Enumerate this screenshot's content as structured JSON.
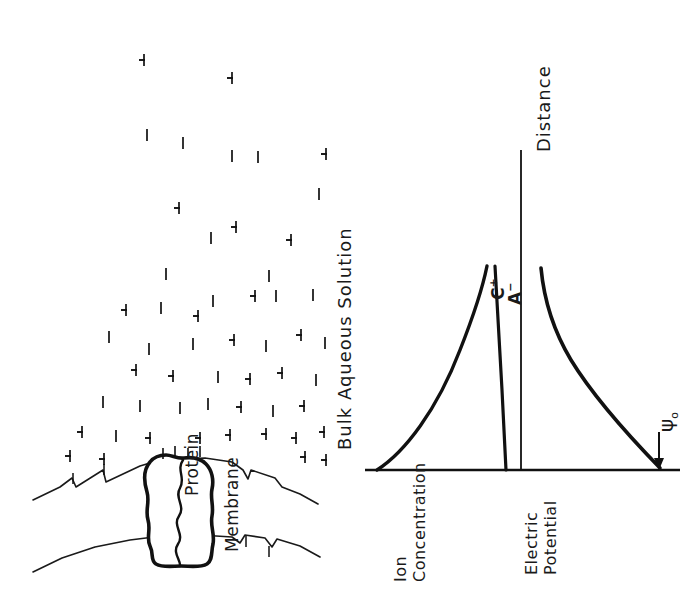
{
  "figure": {
    "type": "scientific-diagram",
    "orientation_note": "rotated-90-ccw",
    "background_color": "#ffffff",
    "ink_color": "#111111"
  },
  "left_panel": {
    "name": "membrane-ion-distribution",
    "solution_label": "Bulk  Aqueous  Solution",
    "protein_label": "Protein",
    "membrane_label": "Membrane",
    "ion_species": {
      "cation_glyph": "+",
      "anion_glyph": "−",
      "cation_name": "cation-plus-ion",
      "anion_name": "anion-minus-ion"
    },
    "surface_charge_note": "negative",
    "ions": [
      {
        "t": "+",
        "x": 136,
        "y": 52,
        "r": 90
      },
      {
        "t": "+",
        "x": 224,
        "y": 70,
        "r": 90
      },
      {
        "t": "−",
        "x": 139,
        "y": 127,
        "r": 90
      },
      {
        "t": "−",
        "x": 175,
        "y": 135,
        "r": 90
      },
      {
        "t": "−",
        "x": 224,
        "y": 148,
        "r": 90
      },
      {
        "t": "−",
        "x": 250,
        "y": 149,
        "r": 90
      },
      {
        "t": "+",
        "x": 318,
        "y": 146,
        "r": 90
      },
      {
        "t": "−",
        "x": 311,
        "y": 186,
        "r": 90
      },
      {
        "t": "+",
        "x": 171,
        "y": 200,
        "r": 90
      },
      {
        "t": "−",
        "x": 203,
        "y": 230,
        "r": 90
      },
      {
        "t": "+",
        "x": 228,
        "y": 219,
        "r": 90
      },
      {
        "t": "+",
        "x": 283,
        "y": 232,
        "r": 90
      },
      {
        "t": "−",
        "x": 158,
        "y": 266,
        "r": 90
      },
      {
        "t": "−",
        "x": 261,
        "y": 268,
        "r": 90
      },
      {
        "t": "+",
        "x": 118,
        "y": 302,
        "r": 90
      },
      {
        "t": "−",
        "x": 153,
        "y": 300,
        "r": 90
      },
      {
        "t": "−",
        "x": 205,
        "y": 293,
        "r": 90
      },
      {
        "t": "+",
        "x": 247,
        "y": 288,
        "r": 90
      },
      {
        "t": "−",
        "x": 268,
        "y": 288,
        "r": 90
      },
      {
        "t": "−",
        "x": 305,
        "y": 287,
        "r": 90
      },
      {
        "t": "+",
        "x": 190,
        "y": 308,
        "r": 90
      },
      {
        "t": "−",
        "x": 101,
        "y": 329,
        "r": 90
      },
      {
        "t": "−",
        "x": 141,
        "y": 341,
        "r": 90
      },
      {
        "t": "−",
        "x": 185,
        "y": 336,
        "r": 90
      },
      {
        "t": "+",
        "x": 226,
        "y": 332,
        "r": 90
      },
      {
        "t": "−",
        "x": 258,
        "y": 338,
        "r": 90
      },
      {
        "t": "+",
        "x": 293,
        "y": 327,
        "r": 90
      },
      {
        "t": "−",
        "x": 317,
        "y": 335,
        "r": 90
      },
      {
        "t": "+",
        "x": 128,
        "y": 362,
        "r": 90
      },
      {
        "t": "+",
        "x": 165,
        "y": 368,
        "r": 90
      },
      {
        "t": "−",
        "x": 210,
        "y": 369,
        "r": 90
      },
      {
        "t": "+",
        "x": 242,
        "y": 371,
        "r": 90
      },
      {
        "t": "+",
        "x": 274,
        "y": 365,
        "r": 90
      },
      {
        "t": "−",
        "x": 308,
        "y": 372,
        "r": 90
      },
      {
        "t": "−",
        "x": 95,
        "y": 394,
        "r": 90
      },
      {
        "t": "−",
        "x": 132,
        "y": 398,
        "r": 90
      },
      {
        "t": "−",
        "x": 172,
        "y": 400,
        "r": 90
      },
      {
        "t": "−",
        "x": 200,
        "y": 396,
        "r": 90
      },
      {
        "t": "+",
        "x": 233,
        "y": 399,
        "r": 90
      },
      {
        "t": "−",
        "x": 265,
        "y": 403,
        "r": 90
      },
      {
        "t": "+",
        "x": 296,
        "y": 398,
        "r": 90
      },
      {
        "t": "+",
        "x": 74,
        "y": 424,
        "r": 90
      },
      {
        "t": "−",
        "x": 108,
        "y": 428,
        "r": 90
      },
      {
        "t": "+",
        "x": 142,
        "y": 430,
        "r": 90
      },
      {
        "t": "+",
        "x": 192,
        "y": 430,
        "r": 90
      },
      {
        "t": "+",
        "x": 222,
        "y": 427,
        "r": 90
      },
      {
        "t": "+",
        "x": 258,
        "y": 426,
        "r": 90
      },
      {
        "t": "+",
        "x": 288,
        "y": 430,
        "r": 90
      },
      {
        "t": "+",
        "x": 316,
        "y": 424,
        "r": 90
      },
      {
        "t": "+",
        "x": 62,
        "y": 448,
        "r": 90
      },
      {
        "t": "+",
        "x": 96,
        "y": 451,
        "r": 90
      },
      {
        "t": "+",
        "x": 297,
        "y": 449,
        "r": 90
      },
      {
        "t": "+",
        "x": 318,
        "y": 452,
        "r": 90
      }
    ],
    "surface_charges": [
      {
        "x": 72,
        "y": 478
      },
      {
        "x": 103,
        "y": 470
      },
      {
        "x": 245,
        "y": 480
      },
      {
        "x": 266,
        "y": 489
      }
    ],
    "channel_charges": [
      {
        "x": 160,
        "y": 455
      },
      {
        "x": 171,
        "y": 453
      },
      {
        "x": 184,
        "y": 455
      },
      {
        "x": 196,
        "y": 453
      }
    ]
  },
  "right_panel": {
    "name": "profiles-plot",
    "distance_axis_label": "Distance",
    "psi_label": "ψ",
    "psi_subscript": "o"
  },
  "chart_data": {
    "type": "line",
    "title": "",
    "xlabel": "Distance",
    "orientation": "rotated-90-ccw",
    "panels": [
      {
        "name": "ion-concentration",
        "ylabel_line1": "Ion",
        "ylabel_line2": "Concentration",
        "ylabel": "Ion Concentration",
        "grid": false,
        "legend_position": "at-curve-peaks",
        "series": [
          {
            "name": "C⁺",
            "label": "C",
            "superscript": "+",
            "description": "cation concentration, decays exponentially from surface to bulk",
            "x": [
              0,
              0.05,
              0.12,
              0.2,
              0.3,
              0.42,
              0.55,
              0.7,
              0.85,
              1.0
            ],
            "values": [
              1.0,
              0.72,
              0.5,
              0.36,
              0.24,
              0.15,
              0.09,
              0.05,
              0.02,
              0.0
            ]
          },
          {
            "name": "A⁻",
            "label": "A",
            "superscript": "−",
            "description": "anion concentration, low near surface rising toward bulk",
            "x": [
              0,
              0.08,
              0.18,
              0.3,
              0.45,
              0.6,
              0.75,
              0.9,
              1.0
            ],
            "values": [
              1.0,
              0.8,
              0.62,
              0.46,
              0.32,
              0.21,
              0.12,
              0.05,
              0.0
            ]
          }
        ]
      },
      {
        "name": "electric-potential",
        "ylabel_line1": "Electric",
        "ylabel_line2": "Potential",
        "ylabel": "Electric Potential",
        "grid": false,
        "annotations": [
          {
            "text": "ψo",
            "name": "psi-zero-annotation",
            "pointer": "arrow-down",
            "at_x": 1.0,
            "at_y": 0.0
          }
        ],
        "series": [
          {
            "name": "ψ",
            "description": "electric potential decaying from surface value to zero in bulk",
            "x": [
              0,
              0.07,
              0.15,
              0.25,
              0.38,
              0.52,
              0.68,
              0.84,
              1.0
            ],
            "values": [
              1.0,
              0.7,
              0.5,
              0.35,
              0.23,
              0.14,
              0.07,
              0.03,
              0.0
            ]
          }
        ]
      }
    ]
  }
}
